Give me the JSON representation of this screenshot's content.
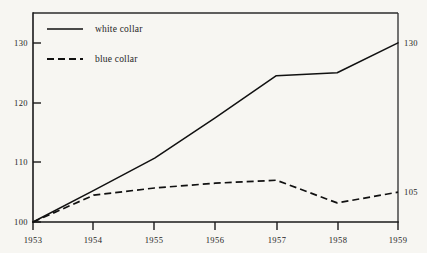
{
  "chart_data": {
    "type": "line",
    "title": "",
    "xlabel": "",
    "ylabel": "",
    "x": [
      1953,
      1954,
      1955,
      1956,
      1957,
      1958,
      1959
    ],
    "xtick_labels": [
      "1953",
      "1954",
      "1955",
      "1956",
      "1957",
      "1958",
      "1959"
    ],
    "ytick_labels": [
      "100",
      "110",
      "120",
      "130"
    ],
    "ytick_values": [
      100,
      110,
      120,
      130
    ],
    "xlim": [
      1953,
      1959
    ],
    "ylim": [
      100,
      132
    ],
    "grid": false,
    "legend_position": "top-left-inside",
    "series": [
      {
        "name": "white collar",
        "style": "solid",
        "values": [
          100,
          105.3,
          110.7,
          117.5,
          124.5,
          125,
          130
        ],
        "end_label": "130"
      },
      {
        "name": "blue collar",
        "style": "dashed",
        "values": [
          100,
          104.5,
          105.7,
          106.5,
          107,
          103.2,
          105
        ],
        "end_label": "105"
      }
    ],
    "colors": {
      "line": "#111111",
      "axis": "#1a1a1a",
      "text": "#252525",
      "background": "#f7f6f2"
    }
  }
}
